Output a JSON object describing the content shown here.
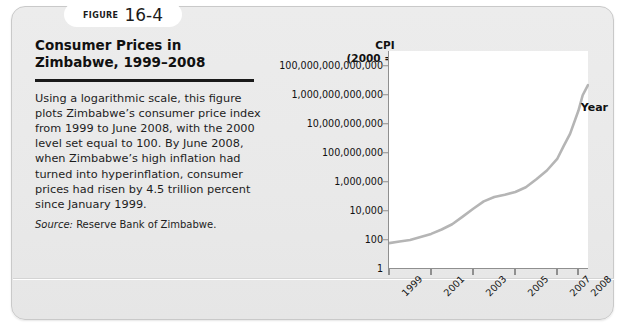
{
  "figure": {
    "label_word": "Figure",
    "number": "16-4",
    "title": "Consumer Prices in Zimbabwe, 1999–2008",
    "body": "Using a logarithmic scale, this figure plots Zimbabwe’s consumer price index from 1999 to June 2008, with the 2000 level set equal to 100. By June 2008, when Zimbabwe’s high inflation had turned into hyperinflation, consumer prices had risen by 4.5 trillion percent since January 1999.",
    "source_label": "Source:",
    "source_text": "Reserve Bank of Zimbabwe."
  },
  "colors": {
    "card_background": "#e9e9e9",
    "card_border": "#c9c9c9",
    "badge_background": "#ffffff",
    "plot_background": "#ffffff",
    "axis": "#8f8f8f",
    "line": "#b5b5b5",
    "text": "#111111",
    "rule": "#1a1a1a"
  },
  "chart_data": {
    "type": "line",
    "title": "Consumer Prices in Zimbabwe, 1999–2008",
    "ylabel": "CPI",
    "ylabel_sub": "(2000 = 100)",
    "xlabel": "Year",
    "grid": false,
    "legend": false,
    "yscale": "log",
    "ylim": [
      1,
      1000000000000000
    ],
    "xlim": [
      1999,
      2008.5
    ],
    "ytick_labels": [
      "1",
      "100",
      "10,000",
      "1,000,000",
      "100,000,000",
      "10,000,000,000",
      "1,000,000,000,000",
      "100,000,000,000,000"
    ],
    "ytick_values": [
      1,
      100,
      10000,
      1000000,
      100000000,
      10000000000,
      1000000000000,
      100000000000000
    ],
    "xtick_labels": [
      "1999",
      "2001",
      "2003",
      "2005",
      "2007",
      "2008"
    ],
    "xtick_values": [
      1999,
      2001,
      2003,
      2005,
      2007,
      2008
    ],
    "series": [
      {
        "name": "Zimbabwe CPI (2000 = 100)",
        "x": [
          1999.0,
          1999.5,
          2000.0,
          2000.5,
          2001.0,
          2001.5,
          2002.0,
          2002.5,
          2003.0,
          2003.5,
          2004.0,
          2004.5,
          2005.0,
          2005.5,
          2006.0,
          2006.5,
          2007.0,
          2007.3,
          2007.6,
          2008.0,
          2008.2,
          2008.45
        ],
        "y": [
          60,
          78,
          100,
          160,
          260,
          520,
          1200,
          4000,
          14000,
          45000,
          90000,
          130000,
          200000,
          420000,
          1500000,
          6000000,
          40000000,
          300000000,
          2000000000,
          80000000000,
          900000000000,
          4500000000000
        ]
      }
    ]
  }
}
